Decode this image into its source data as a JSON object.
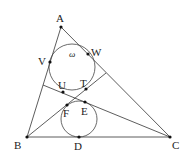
{
  "diagram": {
    "type": "geometry",
    "colors": {
      "stroke": "#333333",
      "point": "#111111",
      "label": "#222222",
      "background": "#ffffff"
    },
    "points": [
      {
        "id": "A",
        "label": "A",
        "x": 61,
        "y": 27,
        "lx": 56,
        "ly": 22
      },
      {
        "id": "B",
        "label": "B",
        "x": 27,
        "y": 137,
        "lx": 14,
        "ly": 149
      },
      {
        "id": "C",
        "label": "C",
        "x": 170,
        "y": 137,
        "lx": 172,
        "ly": 149
      },
      {
        "id": "D",
        "label": "D",
        "x": 79,
        "y": 137,
        "lx": 74,
        "ly": 150
      },
      {
        "id": "V",
        "label": "V",
        "x": 50,
        "y": 62,
        "lx": 38,
        "ly": 65
      },
      {
        "id": "W",
        "label": "W",
        "x": 88,
        "y": 54,
        "lx": 91,
        "ly": 56
      },
      {
        "id": "U",
        "label": "U",
        "x": 63,
        "y": 92,
        "lx": 58,
        "ly": 89
      },
      {
        "id": "T",
        "label": "T",
        "x": 86,
        "y": 89,
        "lx": 80,
        "ly": 87
      },
      {
        "id": "F",
        "label": "F",
        "x": 67,
        "y": 105,
        "lx": 63,
        "ly": 117
      },
      {
        "id": "E",
        "label": "E",
        "x": 85,
        "y": 102,
        "lx": 81,
        "ly": 115
      }
    ],
    "segments": [
      {
        "name": "side-ab",
        "from": "A",
        "to": "B"
      },
      {
        "name": "side-bc",
        "from": "B",
        "to": "C"
      },
      {
        "name": "side-ca",
        "from": "C",
        "to": "A"
      },
      {
        "name": "cevian-from-b",
        "x1": 27,
        "y1": 137,
        "x2": 106,
        "y2": 73
      },
      {
        "name": "cevian-from-c",
        "x1": 170,
        "y1": 137,
        "x2": 43,
        "y2": 85
      }
    ],
    "circles": [
      {
        "name": "circle-omega",
        "label": "ω",
        "cx": 72,
        "cy": 67,
        "r": 23,
        "lx": 69,
        "ly": 57
      },
      {
        "name": "circle-lower",
        "label": "",
        "cx": 79,
        "cy": 119,
        "r": 18
      }
    ]
  }
}
